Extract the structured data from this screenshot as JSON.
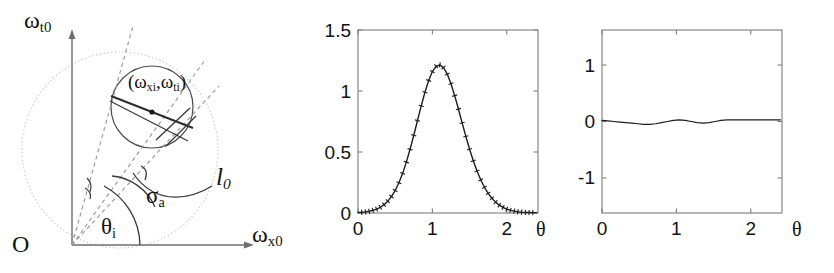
{
  "figure": {
    "panels": [
      "geometry-diagram",
      "magnitude-plot",
      "phase-plot"
    ]
  },
  "diagram": {
    "axis_y_label": "ω",
    "axis_y_sub": "t0",
    "axis_x_label": "ω",
    "axis_x_sub": "x0",
    "origin_label": "O",
    "point_label_open": "(",
    "point_label_w1": "ω",
    "point_label_sub1": "xi",
    "point_label_comma": ",",
    "point_label_w2": "ω",
    "point_label_sub2": "ti",
    "point_label_close": ")",
    "angle_theta": "θ",
    "angle_theta_sub": "i",
    "angle_sigma": "σ",
    "angle_sigma_sub": "a",
    "line_label": "l",
    "line_label_sub": "0",
    "colors": {
      "solid_stroke": "#333333",
      "dashed_stroke": "#8a8a8a",
      "dotted_circle": "#b9b9b9",
      "axis": "#707070"
    }
  },
  "chart_data": [
    {
      "id": "magnitude-plot",
      "type": "line",
      "title": "",
      "xlabel": "θ",
      "ylabel": "",
      "xlim": [
        0,
        2.42
      ],
      "ylim": [
        0,
        1.5
      ],
      "xticks": [
        0,
        1,
        2
      ],
      "xticklabels": [
        "0",
        "1",
        "2"
      ],
      "yticks": [
        0,
        0.5,
        1,
        1.5
      ],
      "yticklabels": [
        "0",
        "0.5",
        "1",
        "1.5"
      ],
      "grid": false,
      "legend": null,
      "markers": "tick-marks along curve",
      "series": [
        {
          "name": "gaussian",
          "x": [
            0.0,
            0.05,
            0.1,
            0.15,
            0.2,
            0.25,
            0.3,
            0.35,
            0.4,
            0.45,
            0.5,
            0.55,
            0.6,
            0.65,
            0.7,
            0.75,
            0.8,
            0.85,
            0.9,
            0.95,
            1.0,
            1.05,
            1.1,
            1.15,
            1.2,
            1.25,
            1.3,
            1.35,
            1.4,
            1.45,
            1.5,
            1.55,
            1.6,
            1.65,
            1.7,
            1.75,
            1.8,
            1.85,
            1.9,
            1.95,
            2.0,
            2.05,
            2.1,
            2.15,
            2.2,
            2.25,
            2.3,
            2.35,
            2.4
          ],
          "y": [
            0.004,
            0.006,
            0.009,
            0.014,
            0.021,
            0.032,
            0.047,
            0.068,
            0.097,
            0.135,
            0.185,
            0.248,
            0.325,
            0.417,
            0.522,
            0.637,
            0.758,
            0.878,
            0.99,
            1.086,
            1.159,
            1.203,
            1.214,
            1.192,
            1.139,
            1.06,
            0.962,
            0.852,
            0.739,
            0.628,
            0.523,
            0.428,
            0.344,
            0.272,
            0.211,
            0.161,
            0.121,
            0.089,
            0.064,
            0.046,
            0.032,
            0.022,
            0.015,
            0.01,
            0.007,
            0.005,
            0.004,
            0.003,
            0.003
          ]
        }
      ],
      "peak_value": 1.4,
      "peak_x": 1.05
    },
    {
      "id": "phase-plot",
      "type": "line",
      "title": "",
      "xlabel": "θ",
      "ylabel": "",
      "xlim": [
        0,
        2.42
      ],
      "ylim": [
        -1.62,
        1.62
      ],
      "xticks": [
        0,
        1,
        2
      ],
      "xticklabels": [
        "0",
        "1",
        "2"
      ],
      "yticks": [
        -1,
        0,
        1
      ],
      "yticklabels": [
        "-1",
        "0",
        "1"
      ],
      "grid": false,
      "legend": null,
      "series": [
        {
          "name": "residual",
          "x": [
            0.0,
            0.08,
            0.16,
            0.24,
            0.32,
            0.4,
            0.48,
            0.56,
            0.64,
            0.72,
            0.8,
            0.88,
            0.96,
            1.04,
            1.12,
            1.2,
            1.28,
            1.36,
            1.44,
            1.52,
            1.6,
            1.68,
            1.76,
            1.84,
            1.92,
            2.0,
            2.08,
            2.16,
            2.24,
            2.32,
            2.4
          ],
          "y": [
            0.02,
            0.01,
            0.0,
            -0.01,
            -0.02,
            -0.03,
            -0.04,
            -0.05,
            -0.05,
            -0.04,
            -0.02,
            0.0,
            0.02,
            0.03,
            0.02,
            0.0,
            -0.02,
            -0.03,
            -0.02,
            0.0,
            0.02,
            0.03,
            0.03,
            0.03,
            0.03,
            0.03,
            0.03,
            0.03,
            0.03,
            0.03,
            0.03
          ]
        }
      ]
    }
  ],
  "axis_label_theta": "θ"
}
